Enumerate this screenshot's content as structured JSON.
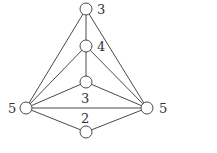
{
  "diagram": {
    "type": "graph",
    "nodes": [
      {
        "id": "top",
        "label": "3"
      },
      {
        "id": "upper-mid",
        "label": "4"
      },
      {
        "id": "center",
        "label": ""
      },
      {
        "id": "left",
        "label": "5"
      },
      {
        "id": "right",
        "label": "5"
      },
      {
        "id": "bottom",
        "label": ""
      }
    ],
    "edges": [
      [
        "top",
        "upper-mid"
      ],
      [
        "top",
        "left"
      ],
      [
        "top",
        "right"
      ],
      [
        "upper-mid",
        "center"
      ],
      [
        "upper-mid",
        "left"
      ],
      [
        "upper-mid",
        "right"
      ],
      [
        "center",
        "left"
      ],
      [
        "center",
        "right"
      ],
      [
        "left",
        "right"
      ],
      [
        "left",
        "bottom"
      ],
      [
        "right",
        "bottom"
      ]
    ],
    "edge_labels": {
      "left-right": "3",
      "bottom-region": "2"
    }
  }
}
